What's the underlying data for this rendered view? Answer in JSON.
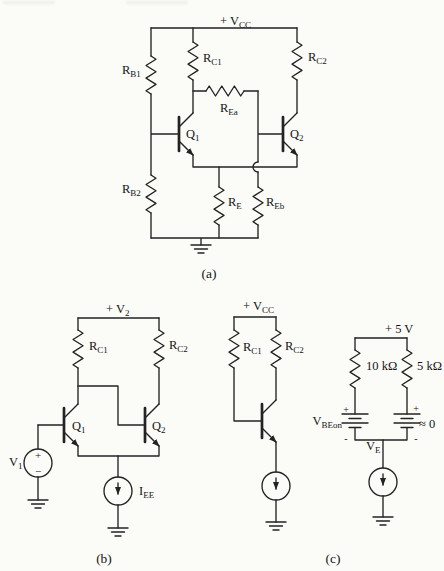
{
  "page": {
    "paper_color": "#fbfbf8",
    "ink_color": "#232323"
  },
  "a": {
    "vcc_main": "+ V",
    "vcc_sub": "CC",
    "rb1_main": "R",
    "rb1_sub": "B1",
    "rb2_main": "R",
    "rb2_sub": "B2",
    "rc1_main": "R",
    "rc1_sub": "C1",
    "rc2_main": "R",
    "rc2_sub": "C2",
    "rea_main": "R",
    "rea_sub": "Ea",
    "re_main": "R",
    "re_sub": "E",
    "reb_main": "R",
    "reb_sub": "Eb",
    "q1_main": "Q",
    "q1_sub": "1",
    "q2_main": "Q",
    "q2_sub": "2",
    "caption": "(a)"
  },
  "b": {
    "v2_main": "+ V",
    "v2_sub": "2",
    "rc1_main": "R",
    "rc1_sub": "C1",
    "rc2_main": "R",
    "rc2_sub": "C2",
    "q1_main": "Q",
    "q1_sub": "1",
    "q2_main": "Q",
    "q2_sub": "2",
    "v1_main": "V",
    "v1_sub": "1",
    "v1_plus": "+",
    "v1_minus": "−",
    "iee_main": "I",
    "iee_sub": "EE",
    "caption": "(b)"
  },
  "c": {
    "vcc_main": "+ V",
    "vcc_sub": "CC",
    "rc1_main": "R",
    "rc1_sub": "C1",
    "rc2_main": "R",
    "rc2_sub": "C2",
    "supply5": "+ 5 V",
    "r10k": "10 kΩ",
    "r5k": "5 kΩ",
    "vbeon_main": "V",
    "vbeon_sub": "BEon",
    "bat1_plus": "+",
    "bat1_minus": "-",
    "bat2_plus": "+",
    "bat2_minus": "-",
    "approx0": "≈ 0",
    "ve_main": "V",
    "ve_sub": "E",
    "caption": "(c)"
  }
}
